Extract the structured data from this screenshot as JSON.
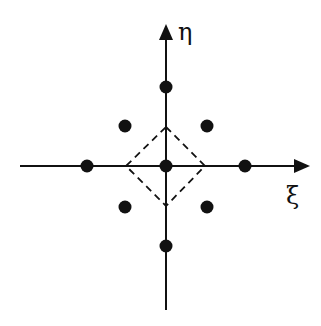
{
  "diagram": {
    "axes": {
      "x_label": "ξ",
      "y_label": "η"
    },
    "points": [
      {
        "id": "top",
        "x": 166,
        "y": 87
      },
      {
        "id": "upper-left",
        "x": 125,
        "y": 126
      },
      {
        "id": "upper-right",
        "x": 207,
        "y": 126
      },
      {
        "id": "left",
        "x": 87,
        "y": 166
      },
      {
        "id": "origin",
        "x": 166,
        "y": 166
      },
      {
        "id": "right",
        "x": 245,
        "y": 166
      },
      {
        "id": "lower-left",
        "x": 125,
        "y": 207
      },
      {
        "id": "lower-right",
        "x": 207,
        "y": 207
      },
      {
        "id": "bottom",
        "x": 166,
        "y": 246
      }
    ],
    "dashed_diamond": {
      "vertices": [
        [
          166,
          127
        ],
        [
          205,
          166
        ],
        [
          166,
          206
        ],
        [
          126,
          166
        ]
      ]
    },
    "colors": {
      "ink": "#111111",
      "background": "#ffffff"
    }
  }
}
